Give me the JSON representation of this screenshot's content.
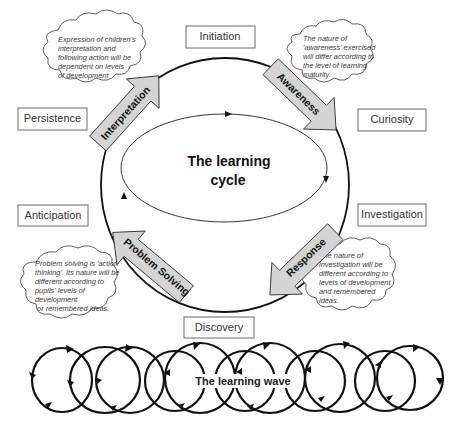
{
  "diagram": {
    "center_title_line1": "The learning",
    "center_title_line2": "cycle",
    "wave_title": "The learning wave",
    "stages": {
      "initiation": "Initiation",
      "curiosity": "Curiosity",
      "investigation": "Investigation",
      "discovery": "Discovery",
      "anticipation": "Anticipation",
      "persistence": "Persistence"
    },
    "arrows": {
      "interpretation": "Interpretation",
      "awareness": "Awareness",
      "response": "Response",
      "problem_solving": "Problem Solving"
    },
    "notes": {
      "interpretation": [
        "Expression of children's",
        "interpretation and",
        "following action will be",
        "dependent on levels",
        "of development"
      ],
      "awareness": [
        "The nature of",
        "'awareness' exercised",
        "will differ according to",
        "the level of learning",
        "maturity."
      ],
      "response": [
        "The nature of",
        "investigation will be",
        "different according to",
        "levels of development",
        "and remembered",
        "ideas."
      ],
      "problem_solving": [
        "Problem solving is 'action",
        "thinking'. Its nature will be",
        "different according to",
        "pupils'  levels of",
        "development",
        " or remembered ideas."
      ]
    },
    "colors": {
      "arrow_fill": "#d4d4d4",
      "line": "#111111",
      "box_border": "#6b6b6b",
      "note_text": "#3a3a3a"
    }
  }
}
